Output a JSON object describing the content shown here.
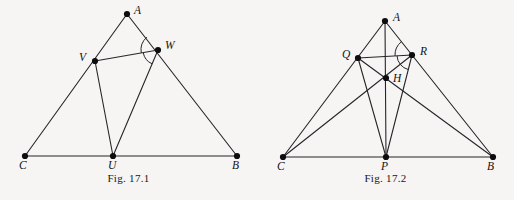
{
  "page": {
    "background_color": "#f6f5f3",
    "ink_color": "#26262a",
    "width": 514,
    "height": 200
  },
  "figures": [
    {
      "id": "fig-17-1",
      "caption": "Fig. 17.1",
      "description": "Triangle ABC with cevian feet U on CB, V on CA, W on AB; segments VW, VU and WU drawn; two angle arcs marked at W.",
      "points": [
        {
          "name": "A",
          "label": "A",
          "x": 127,
          "y": 14,
          "label_x": 134,
          "label_y": 5
        },
        {
          "name": "C",
          "label": "C",
          "x": 25,
          "y": 156,
          "label_x": 19,
          "label_y": 160
        },
        {
          "name": "B",
          "label": "B",
          "x": 237,
          "y": 156,
          "label_x": 232,
          "label_y": 160
        },
        {
          "name": "U",
          "label": "U",
          "x": 113,
          "y": 156,
          "label_x": 108,
          "label_y": 160
        },
        {
          "name": "V",
          "label": "V",
          "x": 95,
          "y": 61,
          "label_x": 79,
          "label_y": 52
        },
        {
          "name": "W",
          "label": "W",
          "x": 158,
          "y": 50,
          "label_x": 165,
          "label_y": 40
        }
      ],
      "segments": [
        {
          "from": "C",
          "to": "A"
        },
        {
          "from": "A",
          "to": "B"
        },
        {
          "from": "C",
          "to": "B"
        },
        {
          "from": "V",
          "to": "W"
        },
        {
          "from": "V",
          "to": "U"
        },
        {
          "from": "W",
          "to": "U"
        }
      ],
      "angle_arcs": [
        {
          "at": "W",
          "between": [
            "A",
            "V"
          ],
          "radius": 17
        },
        {
          "at": "W",
          "between": [
            "V",
            "U"
          ],
          "radius": 15
        }
      ]
    },
    {
      "id": "fig-17-2",
      "caption": "Fig. 17.2",
      "description": "Triangle ABC with foot P on CB, Q on CA, R on AB, interior point H where cevians meet; segments QR, AP, QP, RP, CQ, CR, BQ, BR drawn; two angle arcs marked at R.",
      "points": [
        {
          "name": "A",
          "label": "A",
          "x": 385,
          "y": 21,
          "label_x": 393,
          "label_y": 12
        },
        {
          "name": "C",
          "label": "C",
          "x": 283,
          "y": 157,
          "label_x": 277,
          "label_y": 161
        },
        {
          "name": "B",
          "label": "B",
          "x": 493,
          "y": 157,
          "label_x": 487,
          "label_y": 161
        },
        {
          "name": "P",
          "label": "P",
          "x": 386,
          "y": 157,
          "label_x": 381,
          "label_y": 161
        },
        {
          "name": "Q",
          "label": "Q",
          "x": 358,
          "y": 58,
          "label_x": 342,
          "label_y": 49
        },
        {
          "name": "R",
          "label": "R",
          "x": 412,
          "y": 55,
          "label_x": 420,
          "label_y": 46
        },
        {
          "name": "H",
          "label": "H",
          "x": 386,
          "y": 78,
          "label_x": 393,
          "label_y": 73
        }
      ],
      "segments": [
        {
          "from": "C",
          "to": "A"
        },
        {
          "from": "A",
          "to": "B"
        },
        {
          "from": "C",
          "to": "B"
        },
        {
          "from": "Q",
          "to": "R"
        },
        {
          "from": "A",
          "to": "P"
        },
        {
          "from": "Q",
          "to": "P"
        },
        {
          "from": "R",
          "to": "P"
        },
        {
          "from": "C",
          "to": "R"
        },
        {
          "from": "B",
          "to": "Q"
        }
      ],
      "angle_arcs": [
        {
          "at": "R",
          "between": [
            "A",
            "Q"
          ],
          "radius": 17
        },
        {
          "at": "R",
          "between": [
            "Q",
            "P"
          ],
          "radius": 15
        }
      ]
    }
  ]
}
